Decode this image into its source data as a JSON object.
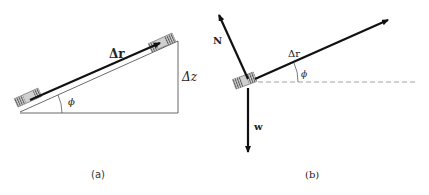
{
  "figure_a": {
    "caption": "(a)",
    "labels": {
      "displacement": "Δr",
      "height": "Δz",
      "angle": "ϕ"
    }
  },
  "figure_b": {
    "caption": "(b)",
    "labels": {
      "normal_force": "N",
      "displacement": "Δr",
      "angle": "ϕ",
      "weight": "w"
    }
  },
  "colors": {
    "line": "#111111",
    "block_fill": "#cfcfcf",
    "block_stripes": "#555555",
    "dashed": "#888888"
  }
}
